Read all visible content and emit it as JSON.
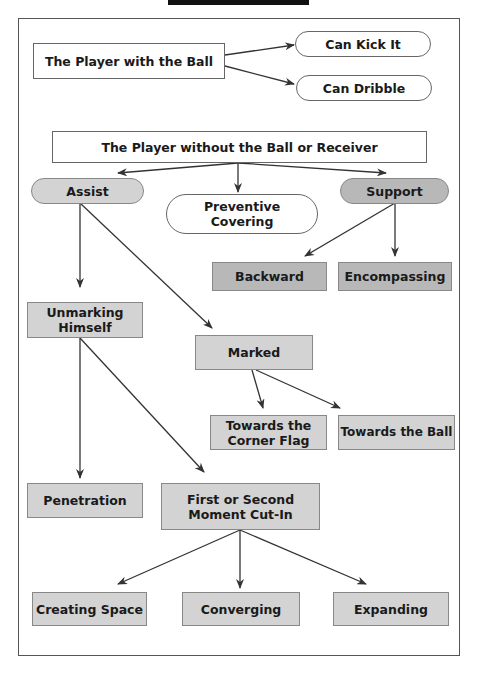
{
  "title_bar": {
    "color": "#111111"
  },
  "colors": {
    "light_fill": "#d3d3d3",
    "dark_fill": "#b8b8b8",
    "border": "#666666",
    "arrow": "#333333"
  },
  "nodes": {
    "player_with_ball": "The Player with the Ball",
    "can_kick_it": "Can Kick It",
    "can_dribble": "Can Dribble",
    "player_without_ball": "The Player without the Ball or Receiver",
    "assist": "Assist",
    "preventive_covering": "Preventive Covering",
    "support": "Support",
    "backward": "Backward",
    "encompassing": "Encompassing",
    "unmarking_himself": "Unmarking Himself",
    "marked": "Marked",
    "towards_corner_flag": "Towards the Corner Flag",
    "towards_ball": "Towards the Ball",
    "penetration": "Penetration",
    "first_second_cut_in": "First or Second Moment Cut-In",
    "creating_space": "Creating Space",
    "converging": "Converging",
    "expanding": "Expanding"
  },
  "edges": [
    [
      "player_with_ball",
      "can_kick_it"
    ],
    [
      "player_with_ball",
      "can_dribble"
    ],
    [
      "player_without_ball",
      "assist"
    ],
    [
      "player_without_ball",
      "preventive_covering"
    ],
    [
      "player_without_ball",
      "support"
    ],
    [
      "assist",
      "unmarking_himself"
    ],
    [
      "assist",
      "marked"
    ],
    [
      "support",
      "backward"
    ],
    [
      "support",
      "encompassing"
    ],
    [
      "marked",
      "towards_corner_flag"
    ],
    [
      "marked",
      "towards_ball"
    ],
    [
      "unmarking_himself",
      "penetration"
    ],
    [
      "unmarking_himself",
      "first_second_cut_in"
    ],
    [
      "first_second_cut_in",
      "creating_space"
    ],
    [
      "first_second_cut_in",
      "converging"
    ],
    [
      "first_second_cut_in",
      "expanding"
    ]
  ]
}
